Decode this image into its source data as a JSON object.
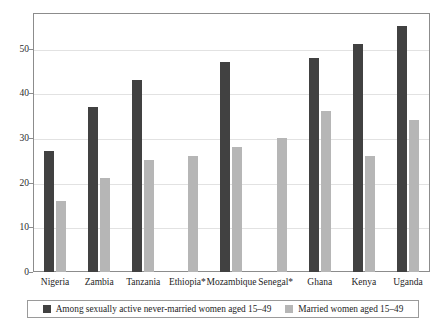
{
  "chart_data": {
    "type": "bar",
    "title": "",
    "subtitle": "",
    "xlabel": "",
    "ylabel": "",
    "ylim": [
      0,
      58
    ],
    "yticks": [
      0,
      10,
      20,
      30,
      40,
      50
    ],
    "ytick_labels": [
      "0",
      "10",
      "20",
      "30",
      "40",
      "50"
    ],
    "grid": true,
    "legend_position": "bottom",
    "categories": [
      "Nigeria",
      "Zambia",
      "Tanzania",
      "Ethiopia*",
      "Mozambique",
      "Senegal*",
      "Ghana",
      "Kenya",
      "Uganda"
    ],
    "series": [
      {
        "name": "Among sexually active never-married women aged 15–49",
        "color": "#414141",
        "values": [
          27,
          37,
          43,
          null,
          47,
          null,
          48,
          51,
          55
        ]
      },
      {
        "name": "Married women aged 15–49",
        "color": "#b6b6b6",
        "values": [
          16,
          21,
          25,
          26,
          28,
          30,
          36,
          26,
          34
        ]
      }
    ]
  },
  "colors": {
    "series_dark": "#414141",
    "series_light": "#b6b6b6",
    "gridline": "#e2e2e2",
    "frame": "#8c8c8c",
    "background": "#ffffff",
    "text": "#1e1e1e"
  }
}
